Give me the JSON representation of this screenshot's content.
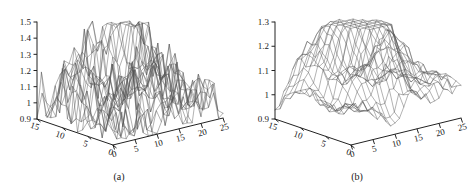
{
  "figure": {
    "background_color": "#ffffff",
    "line_color": "#555555",
    "axis_color": "#222222",
    "width": 476,
    "height": 188
  },
  "panels": [
    {
      "id": "a",
      "caption": "(a)",
      "z_ticks": [
        "0.9",
        "1",
        "1.1",
        "1.2",
        "1.3",
        "1.4",
        "1.5"
      ],
      "y_ticks": [
        "15",
        "10",
        "5",
        "0"
      ],
      "x_ticks": [
        "0",
        "5",
        "10",
        "15",
        "20",
        "25"
      ],
      "surface_style": "noisy"
    },
    {
      "id": "b",
      "caption": "(b)",
      "z_ticks": [
        "0.9",
        "1",
        "1.1",
        "1.2",
        "1.3"
      ],
      "y_ticks": [
        "15",
        "10",
        "5",
        "0"
      ],
      "x_ticks": [
        "0",
        "5",
        "10",
        "15",
        "20",
        "25"
      ],
      "surface_style": "smoothed"
    }
  ],
  "chart_data": [
    {
      "type": "surface",
      "panel": "a",
      "title": "(a)",
      "xlabel": "",
      "ylabel": "",
      "zlabel": "",
      "xlim": [
        0,
        25
      ],
      "ylim": [
        0,
        15
      ],
      "zlim": [
        0.9,
        1.5
      ],
      "xticks": [
        0,
        5,
        10,
        15,
        20,
        25
      ],
      "yticks": [
        0,
        5,
        10,
        15
      ],
      "zticks": [
        0.9,
        1.0,
        1.1,
        1.2,
        1.3,
        1.4,
        1.5
      ],
      "grid": false,
      "legend": null,
      "description": "Raw noisy 3D wireframe surface of a response field over a 25 x 15 grid; baseline near 1.0 with sharp isolated spikes reaching about 1.5 in the central region.",
      "baseline": 1.0,
      "peak_value": 1.5,
      "noise_amplitude": 0.12,
      "nx": 26,
      "ny": 16,
      "peaks": [
        {
          "x": 10.5,
          "y": 8.0,
          "height": 0.44,
          "sigma_x": 2.2,
          "sigma_y": 2.0
        },
        {
          "x": 13.5,
          "y": 6.0,
          "height": 0.33,
          "sigma_x": 1.8,
          "sigma_y": 1.7
        },
        {
          "x": 8.0,
          "y": 10.5,
          "height": 0.22,
          "sigma_x": 2.0,
          "sigma_y": 2.2
        },
        {
          "x": 17.0,
          "y": 7.5,
          "height": 0.19,
          "sigma_x": 2.4,
          "sigma_y": 2.0
        },
        {
          "x": 4.5,
          "y": 11.0,
          "height": 0.13,
          "sigma_x": 2.6,
          "sigma_y": 2.4
        },
        {
          "x": 20.0,
          "y": 5.0,
          "height": 0.1,
          "sigma_x": 2.2,
          "sigma_y": 2.2
        }
      ]
    },
    {
      "type": "surface",
      "panel": "b",
      "title": "(b)",
      "xlabel": "",
      "ylabel": "",
      "zlabel": "",
      "xlim": [
        0,
        25
      ],
      "ylim": [
        0,
        15
      ],
      "zlim": [
        0.9,
        1.3
      ],
      "xticks": [
        0,
        5,
        10,
        15,
        20,
        25
      ],
      "yticks": [
        0,
        5,
        10,
        15
      ],
      "zticks": [
        0.9,
        1.0,
        1.1,
        1.2,
        1.3
      ],
      "grid": false,
      "legend": null,
      "description": "Smoothed 3D wireframe surface of the same response field; regular mesh with a single broad central ridge peaking near 1.3 and gentle undulations near the baseline of 1.0.",
      "baseline": 1.0,
      "peak_value": 1.3,
      "noise_amplitude": 0.022,
      "nx": 26,
      "ny": 16,
      "peaks": [
        {
          "x": 10.5,
          "y": 8.0,
          "height": 0.3,
          "sigma_x": 3.0,
          "sigma_y": 2.8
        },
        {
          "x": 13.5,
          "y": 6.0,
          "height": 0.2,
          "sigma_x": 2.6,
          "sigma_y": 2.4
        },
        {
          "x": 8.0,
          "y": 10.5,
          "height": 0.13,
          "sigma_x": 2.8,
          "sigma_y": 3.0
        },
        {
          "x": 17.0,
          "y": 7.5,
          "height": 0.12,
          "sigma_x": 3.2,
          "sigma_y": 2.8
        },
        {
          "x": 4.5,
          "y": 11.0,
          "height": 0.09,
          "sigma_x": 3.4,
          "sigma_y": 3.2
        },
        {
          "x": 20.0,
          "y": 5.0,
          "height": 0.07,
          "sigma_x": 3.0,
          "sigma_y": 3.0
        }
      ]
    }
  ]
}
